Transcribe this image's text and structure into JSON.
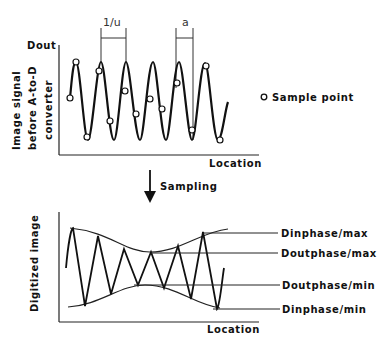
{
  "top_plot": {
    "y_axis_top_label": "Dout",
    "y_axis_label_lines": [
      "Image signal",
      "before A-to-D",
      "converter"
    ],
    "x_axis_label": "Location",
    "period_label": "1/u",
    "spacing_label": "a",
    "legend": {
      "marker": "circle",
      "label": "Sample point"
    }
  },
  "arrow": {
    "label": "Sampling"
  },
  "bottom_plot": {
    "y_axis_label": "Digitized image",
    "x_axis_label": "Location",
    "annotations": [
      "Dinphase/max",
      "Doutphase/max",
      "Doutphase/min",
      "Dinphase/min"
    ]
  }
}
